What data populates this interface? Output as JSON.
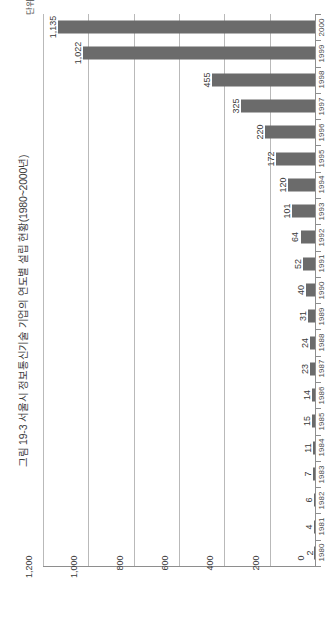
{
  "figure": {
    "title": "그림 19-3 서울시 정보통신기술 기업의 연도별 설립 현황(1980~2000년)",
    "unit_note": "단위: 개",
    "bar_color": "#6b6b6b",
    "grid_color": "#b9b9b9",
    "axis_color": "#8e8e8e"
  },
  "chart_data": {
    "type": "bar",
    "orientation": "horizontal",
    "title": "그림 19-3 서울시 정보통신기술 기업의 연도별 설립 현황(1980~2000년)",
    "subtitle": "",
    "xlabel": "",
    "ylabel": "단위: 개",
    "categories": [
      "2000",
      "1999",
      "1998",
      "1997",
      "1996",
      "1995",
      "1994",
      "1993",
      "1992",
      "1991",
      "1990",
      "1989",
      "1988",
      "1987",
      "1986",
      "1985",
      "1984",
      "1983",
      "1982",
      "1981",
      "1980"
    ],
    "values": [
      1135,
      1022,
      455,
      325,
      220,
      172,
      120,
      101,
      64,
      52,
      40,
      31,
      24,
      23,
      14,
      15,
      11,
      7,
      6,
      4,
      2
    ],
    "value_labels": [
      "1,135",
      "1,022",
      "455",
      "325",
      "220",
      "172",
      "120",
      "101",
      "64",
      "52",
      "40",
      "31",
      "24",
      "23",
      "14",
      "15",
      "11",
      "7",
      "6",
      "4",
      "2"
    ],
    "xlim": [
      0,
      1200
    ],
    "xticks": [
      1200,
      1000,
      800,
      600,
      400,
      200,
      0
    ],
    "xtick_labels": [
      "1,200",
      "1,000",
      "800",
      "600",
      "400",
      "200",
      "0"
    ],
    "grid": true,
    "grid_axis": "value",
    "legend": "none",
    "series": [
      {
        "name": "설립 기업 수",
        "values": [
          1135,
          1022,
          455,
          325,
          220,
          172,
          120,
          101,
          64,
          52,
          40,
          31,
          24,
          23,
          14,
          15,
          11,
          7,
          6,
          4,
          2
        ]
      }
    ]
  }
}
